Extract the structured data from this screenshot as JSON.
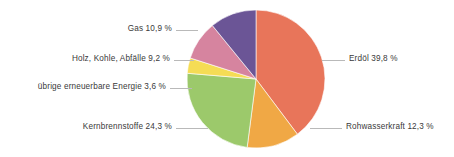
{
  "chart_data": {
    "type": "pie",
    "title": "",
    "subtitle": "",
    "xlabel": "",
    "ylabel": "",
    "legend_position": "callout-labels",
    "grid": false,
    "unit": "%",
    "decimal_separator": ",",
    "start_angle_deg": 0,
    "direction": "clockwise",
    "categories": [
      "Erdöl",
      "Rohwasserkraft",
      "Kernbrennstoffe",
      "übrige erneuerbare Energie",
      "Holz, Kohle, Abfälle",
      "Gas"
    ],
    "values": [
      39.8,
      12.3,
      24.3,
      3.6,
      9.2,
      10.9
    ],
    "colors": [
      "#e8755a",
      "#f0a845",
      "#9cc96b",
      "#f5dc55",
      "#d6849f",
      "#6b5596"
    ],
    "slices": [
      {
        "id": "erdoel",
        "label": "Erdöl 39,8 %",
        "name": "Erdöl",
        "value": 39.8,
        "value_text": "39,8 %",
        "color": "#e8755a",
        "side": "right"
      },
      {
        "id": "rohwasserkraft",
        "label": "Rohwasserkraft 12,3 %",
        "name": "Rohwasserkraft",
        "value": 12.3,
        "value_text": "12,3 %",
        "color": "#f0a845",
        "side": "right"
      },
      {
        "id": "kernbrennstoffe",
        "label": "Kernbrennstoffe 24,3 %",
        "name": "Kernbrennstoffe",
        "value": 24.3,
        "value_text": "24,3 %",
        "color": "#9cc96b",
        "side": "left"
      },
      {
        "id": "uebrige-erneuerbare-energie",
        "label": "übrige erneuerbare Energie 3,6 %",
        "name": "übrige erneuerbare Energie",
        "value": 3.6,
        "value_text": "3,6 %",
        "color": "#f5dc55",
        "side": "left"
      },
      {
        "id": "holz-kohle-abfaelle",
        "label": "Holz, Kohle, Abfälle 9,2 %",
        "name": "Holz, Kohle, Abfälle",
        "value": 9.2,
        "value_text": "9,2 %",
        "color": "#d6849f",
        "side": "left"
      },
      {
        "id": "gas",
        "label": "Gas 10,9 %",
        "name": "Gas",
        "value": 10.9,
        "value_text": "10,9 %",
        "color": "#6b5596",
        "side": "left"
      }
    ]
  },
  "geometry": {
    "center_x": 256,
    "center_y": 79,
    "radius": 69
  },
  "colors": {
    "background": "#ffffff",
    "text": "#3a3a3a",
    "leader_line": "#b9b9b9"
  }
}
